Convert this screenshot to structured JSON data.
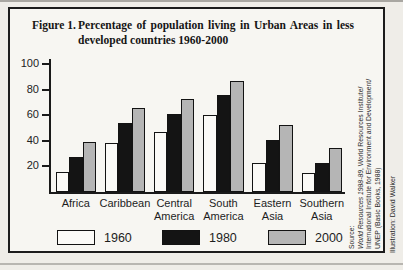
{
  "figure": {
    "label": "Figure 1.",
    "title_line1": "Percentage of population living in Urban Areas in less",
    "title_line2": "developed countries 1960-2000"
  },
  "chart_data": {
    "type": "bar",
    "title": "Figure 1. Percentage of population living in Urban Areas in less developed countries 1960-2000",
    "categories": [
      "Africa",
      "Caribbean",
      "Central America",
      "South America",
      "Eastern Asia",
      "Southern Asia"
    ],
    "series": [
      {
        "name": "1960",
        "color": "#fbfaf7",
        "values": [
          16,
          38,
          47,
          60,
          23,
          15
        ]
      },
      {
        "name": "1980",
        "color": "#141414",
        "values": [
          27,
          54,
          61,
          76,
          41,
          23
        ]
      },
      {
        "name": "2000",
        "color": "#b5b5b5",
        "values": [
          39,
          66,
          73,
          87,
          52,
          34
        ]
      }
    ],
    "ylim": [
      0,
      100
    ],
    "yticks": [
      20,
      40,
      60,
      80,
      100
    ],
    "xlabel": "",
    "ylabel": "",
    "grid": false,
    "legend_position": "bottom"
  },
  "source": {
    "heading": "Source:",
    "work": "World Resources 1988-89",
    "line1_rest": ", World Resources Institute/",
    "line2": "International Institute for Environment and Development/",
    "line3": "UNEP (Basic Books, 1988)"
  },
  "credit": "Illustration: David Walker"
}
